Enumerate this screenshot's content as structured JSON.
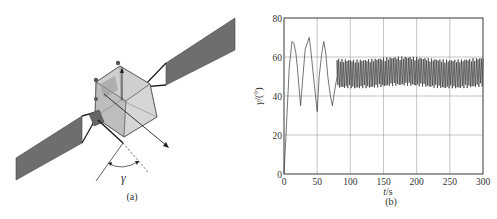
{
  "panels": {
    "a": {
      "label": "(a)",
      "angle_symbol": "γ",
      "description": "satellite with two solar panels and body axes"
    },
    "b": {
      "label": "(b)"
    }
  },
  "colors": {
    "panel_fill": "#6e6e6e",
    "body_fill": "#d4d4d4",
    "line": "#3a3a3a",
    "grid": "#8a8a8a",
    "curve": "#3a3a3a"
  },
  "caption": "",
  "chart_data": {
    "type": "line",
    "title": "",
    "xlabel": "t/s",
    "ylabel": "γ/(°)",
    "xlim": [
      0,
      300
    ],
    "ylim": [
      0,
      80
    ],
    "xticks": [
      0,
      50,
      100,
      150,
      200,
      250,
      300
    ],
    "yticks": [
      0,
      20,
      40,
      60,
      80
    ],
    "xtick_labels": [
      "0",
      "50",
      "100",
      "150",
      "200",
      "250",
      "300"
    ],
    "ytick_labels": [
      "0",
      "20",
      "40",
      "60",
      "80"
    ],
    "grid": true,
    "legend": null,
    "series": [
      {
        "name": "γ",
        "x": [
          0,
          3,
          8,
          12,
          15,
          18,
          20,
          25,
          28,
          32,
          38,
          40,
          43,
          46,
          50,
          53,
          57,
          60,
          63,
          66,
          70,
          73,
          76,
          80,
          85,
          90,
          100,
          150,
          200,
          250,
          300
        ],
        "y": [
          0,
          20,
          55,
          68,
          67,
          62,
          55,
          35,
          48,
          64,
          70,
          65,
          55,
          45,
          32,
          50,
          62,
          68,
          62,
          50,
          40,
          35,
          42,
          50,
          53,
          52,
          52,
          52,
          52,
          52,
          52
        ],
        "envelope_after_80s": {
          "min": 45,
          "max": 60,
          "mean": 52
        },
        "note": "high-frequency oscillation between ~45° and ~60° after t≈80 s"
      }
    ]
  }
}
